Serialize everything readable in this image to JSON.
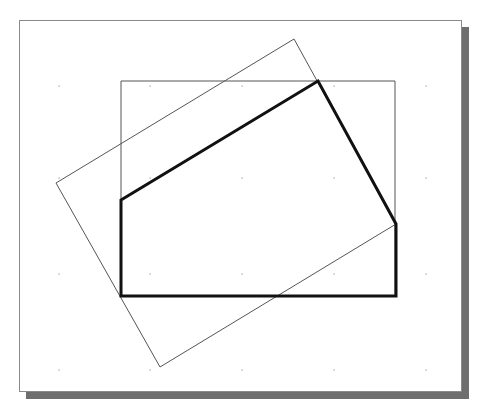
{
  "canvas": {
    "width": 488,
    "height": 412,
    "background": "#ffffff"
  },
  "frame": {
    "x": 19,
    "y": 20,
    "width": 443,
    "height": 372,
    "border_color": "#8a8a8a",
    "shadow_color": "#6e6e6e",
    "shadow_offset": 7
  },
  "grid_dots": {
    "xs": [
      59,
      150,
      242,
      334,
      426
    ],
    "ys": [
      86,
      178,
      274,
      370
    ],
    "color": "#9a9a9a"
  },
  "shapes": {
    "axis_rectangle": {
      "points": [
        [
          121,
          81
        ],
        [
          395,
          81
        ],
        [
          395,
          296
        ],
        [
          121,
          296
        ]
      ],
      "stroke": "#555555",
      "stroke_width": 1
    },
    "rotated_rectangle": {
      "points": [
        [
          56,
          183
        ],
        [
          294,
          39
        ],
        [
          396,
          224
        ],
        [
          160,
          367
        ]
      ],
      "stroke": "#555555",
      "stroke_width": 1
    },
    "clipped_polygon": {
      "points": [
        [
          121,
          200
        ],
        [
          318,
          81
        ],
        [
          396,
          224
        ],
        [
          396,
          296
        ],
        [
          121,
          296
        ]
      ],
      "stroke": "#111111",
      "stroke_width": 3
    }
  }
}
